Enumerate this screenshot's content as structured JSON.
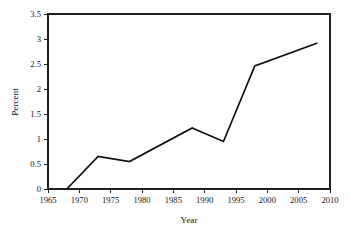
{
  "chart_data": {
    "type": "line",
    "title": "",
    "xlabel": "Year",
    "ylabel": "Percent",
    "xlim": [
      1965,
      2010
    ],
    "ylim": [
      0,
      3.5
    ],
    "grid": false,
    "legend": null,
    "xticks": [
      1965,
      1970,
      1975,
      1980,
      1985,
      1990,
      1995,
      2000,
      2005,
      2010
    ],
    "xtick_labels": [
      "1965",
      "1970",
      "1975",
      "1980",
      "1985",
      "1990",
      "1995",
      "2000",
      "2005",
      "2010"
    ],
    "yticks": [
      0,
      0.5,
      1,
      1.5,
      2,
      2.5,
      3,
      3.5
    ],
    "ytick_labels": [
      "0",
      "0.5",
      "1",
      "1.5",
      "2",
      "2.5",
      "3",
      "3.5"
    ],
    "series": [
      {
        "name": "Percent",
        "color": "#0d0d0d",
        "x": [
          1968,
          1973,
          1978,
          1988,
          1993,
          1998,
          2008
        ],
        "values": [
          0,
          0.65,
          0.55,
          1.22,
          0.95,
          2.46,
          2.92
        ]
      }
    ]
  },
  "axes": {
    "frame_color": "#1f1f1f",
    "background": "#ffffff"
  }
}
